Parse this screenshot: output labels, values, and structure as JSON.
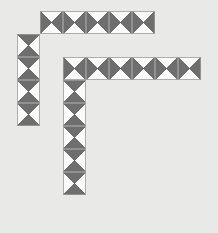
{
  "canvas": {
    "width": 218,
    "height": 233,
    "background_color": "#e9e9e7",
    "cell_size": 23,
    "origin_x": 17,
    "origin_y": 11
  },
  "palette": {
    "dark_triangle": "#6e6e6e",
    "light_triangle": "#fbfbfa",
    "cell_border": "#9a9a98",
    "diagonal_line": "#5a5a5a"
  },
  "legend": {
    "tile_type_horizontal": "horizontal-diamond",
    "tile_type_vertical": "vertical-diamond",
    "description": "square tile split by both diagonals into four triangles; two opposite triangles shaded dark"
  },
  "pieces": [
    {
      "name": "top-bar-piece",
      "orientation": "horizontal",
      "tile_count": 5,
      "tiles": [
        {
          "col": 1,
          "row": 0,
          "pattern": "horizontal-diamond"
        },
        {
          "col": 2,
          "row": 0,
          "pattern": "horizontal-diamond"
        },
        {
          "col": 3,
          "row": 0,
          "pattern": "horizontal-diamond"
        },
        {
          "col": 4,
          "row": 0,
          "pattern": "horizontal-diamond"
        },
        {
          "col": 5,
          "row": 0,
          "pattern": "horizontal-diamond"
        }
      ]
    },
    {
      "name": "left-column-piece",
      "orientation": "vertical",
      "tile_count": 4,
      "tiles": [
        {
          "col": 0,
          "row": 1,
          "pattern": "vertical-diamond"
        },
        {
          "col": 0,
          "row": 2,
          "pattern": "vertical-diamond"
        },
        {
          "col": 0,
          "row": 3,
          "pattern": "vertical-diamond"
        },
        {
          "col": 0,
          "row": 4,
          "pattern": "vertical-diamond"
        }
      ]
    },
    {
      "name": "gamma-piece",
      "orientation": "corner",
      "tile_count": 11,
      "tiles": [
        {
          "col": 2,
          "row": 2,
          "pattern": "horizontal-diamond"
        },
        {
          "col": 3,
          "row": 2,
          "pattern": "horizontal-diamond"
        },
        {
          "col": 4,
          "row": 2,
          "pattern": "horizontal-diamond"
        },
        {
          "col": 5,
          "row": 2,
          "pattern": "horizontal-diamond"
        },
        {
          "col": 6,
          "row": 2,
          "pattern": "horizontal-diamond"
        },
        {
          "col": 7,
          "row": 2,
          "pattern": "horizontal-diamond"
        },
        {
          "col": 2,
          "row": 3,
          "pattern": "vertical-diamond"
        },
        {
          "col": 2,
          "row": 4,
          "pattern": "vertical-diamond"
        },
        {
          "col": 2,
          "row": 5,
          "pattern": "vertical-diamond"
        },
        {
          "col": 2,
          "row": 6,
          "pattern": "vertical-diamond"
        },
        {
          "col": 2,
          "row": 7,
          "pattern": "vertical-diamond"
        }
      ]
    }
  ]
}
